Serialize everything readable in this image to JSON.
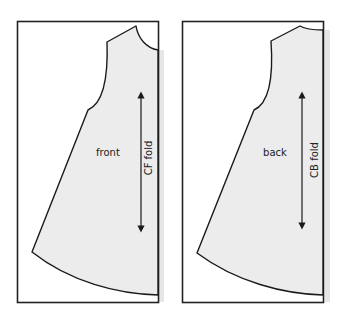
{
  "diagram": {
    "type": "sewing-pattern-pieces",
    "colors": {
      "outline": "#1a1a1a",
      "fill": "#ececec",
      "frame": "#222222",
      "shadow": "#e6e6e6",
      "background": "#ffffff"
    },
    "pieces": [
      {
        "id": "front",
        "label": "front",
        "fold_label": "CF fold",
        "grainline": "double-headed arrow"
      },
      {
        "id": "back",
        "label": "back",
        "fold_label": "CB fold",
        "grainline": "double-headed arrow"
      }
    ]
  }
}
